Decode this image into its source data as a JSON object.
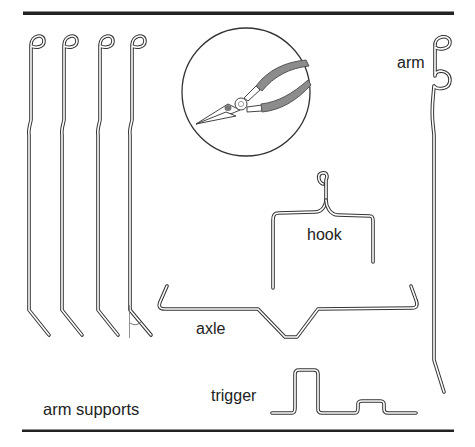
{
  "diagram": {
    "colors": {
      "background": "#ffffff",
      "rule": "#222222",
      "wire_outline": "#333333",
      "wire_fill": "#ffffff",
      "plier_handle": "#8c8c8c",
      "label": "#222222"
    },
    "labels": {
      "arm_supports": "arm supports",
      "arm": "arm",
      "hook": "hook",
      "axle": "axle",
      "trigger": "trigger"
    },
    "parts": [
      {
        "id": "arm-supports",
        "label": "arm supports",
        "count": 4
      },
      {
        "id": "arm",
        "label": "arm",
        "count": 1
      },
      {
        "id": "hook",
        "label": "hook",
        "count": 1
      },
      {
        "id": "axle",
        "label": "axle",
        "count": 1
      },
      {
        "id": "trigger",
        "label": "trigger",
        "count": 1
      }
    ],
    "tool": {
      "name": "needle-nose pliers",
      "icon": "pliers-icon"
    }
  }
}
